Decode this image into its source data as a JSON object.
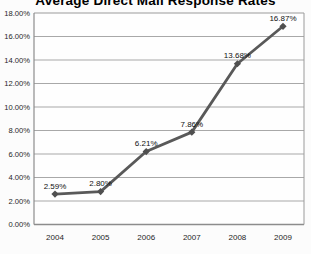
{
  "chart_data": {
    "type": "line",
    "title": "Average Direct Mail Response Rates",
    "categories": [
      "2004",
      "2005",
      "2006",
      "2007",
      "2008",
      "2009"
    ],
    "series": [
      {
        "name": "Average Direct Mail Response Rates",
        "values": [
          2.59,
          2.8,
          6.21,
          7.86,
          13.68,
          16.87
        ]
      }
    ],
    "data_labels": [
      "2.59%",
      "2.80%",
      "6.21%",
      "7.86%",
      "13.68%",
      "16.87%"
    ],
    "xlabel": "",
    "ylabel": "",
    "ylim": [
      0,
      18
    ],
    "ytick_step": 2,
    "ytick_labels": [
      "0.00%",
      "2.00%",
      "4.00%",
      "6.00%",
      "8.00%",
      "10.00%",
      "12.00%",
      "14.00%",
      "16.00%",
      "18.00%"
    ],
    "grid": true,
    "legend_position": "none",
    "colors": {
      "line": "#595959",
      "marker": "#4f4f4f",
      "grid": "#a8a8a8",
      "frame": "#9a9a9a",
      "axis": "#8c8c8c",
      "tick_text": "#262626",
      "label_text": "#111111",
      "plot_background": "#fefefe",
      "page_background": "#fcfcfc"
    }
  }
}
